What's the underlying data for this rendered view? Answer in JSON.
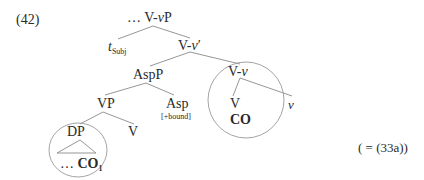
{
  "example_number": "(42)",
  "cross_reference": "( = (33a))",
  "tree": {
    "root": {
      "prefix": "…",
      "label_a": "V-",
      "label_v": "v",
      "label_b": "P"
    },
    "spec": {
      "label": "t",
      "subscript": "Subj"
    },
    "vbar": {
      "label_a": "V-",
      "label_v": "v",
      "label_b": "′"
    },
    "aspp": {
      "label": "AspP"
    },
    "vv": {
      "label_a": "V-",
      "label_v": "v",
      "circled": true
    },
    "vp": {
      "label": "VP"
    },
    "asp": {
      "label": "Asp",
      "feature": "[+bound]"
    },
    "v_head": {
      "label": "V",
      "content": "CO"
    },
    "little_v": {
      "label": "v"
    },
    "dp": {
      "label": "DP",
      "content_prefix": "…",
      "content": "CO",
      "subscript": "1",
      "circled": true
    },
    "v_low": {
      "label": "V"
    }
  },
  "colors": {
    "text": "#2a2a2a",
    "lines": "#8a8a8a",
    "circles": "#9a9a9a"
  }
}
